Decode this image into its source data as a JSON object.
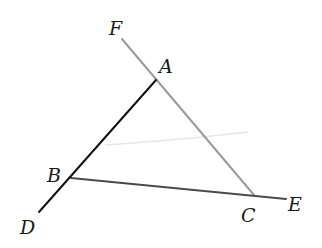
{
  "diagram": {
    "type": "geometry",
    "points": {
      "A": {
        "label": "A",
        "x": 156,
        "y": 80,
        "label_x": 159,
        "label_y": 73
      },
      "B": {
        "label": "B",
        "x": 71,
        "y": 178,
        "label_x": 47,
        "label_y": 182
      },
      "C": {
        "label": "C",
        "x": 254,
        "y": 195,
        "label_x": 241,
        "label_y": 222
      },
      "D": {
        "label": "D",
        "x": 39,
        "y": 212,
        "label_x": 20,
        "label_y": 234
      },
      "E": {
        "label": "E",
        "x": 286,
        "y": 199,
        "label_x": 288,
        "label_y": 211
      },
      "F": {
        "label": "F",
        "x": 122,
        "y": 39,
        "label_x": 109,
        "label_y": 35
      }
    },
    "segments": [
      {
        "name": "DA",
        "from": "D",
        "to": "A",
        "color": "#111111",
        "width": 2
      },
      {
        "name": "BE",
        "from": "B",
        "to": "E",
        "color": "#4a4a4a",
        "width": 2
      },
      {
        "name": "FC",
        "from": "F",
        "to": "C",
        "color": "#9a9a9a",
        "width": 2
      }
    ],
    "colors": {
      "background": "#ffffff",
      "label": "#1a1a1a",
      "artifact_arc": "#e4e4e4"
    }
  }
}
